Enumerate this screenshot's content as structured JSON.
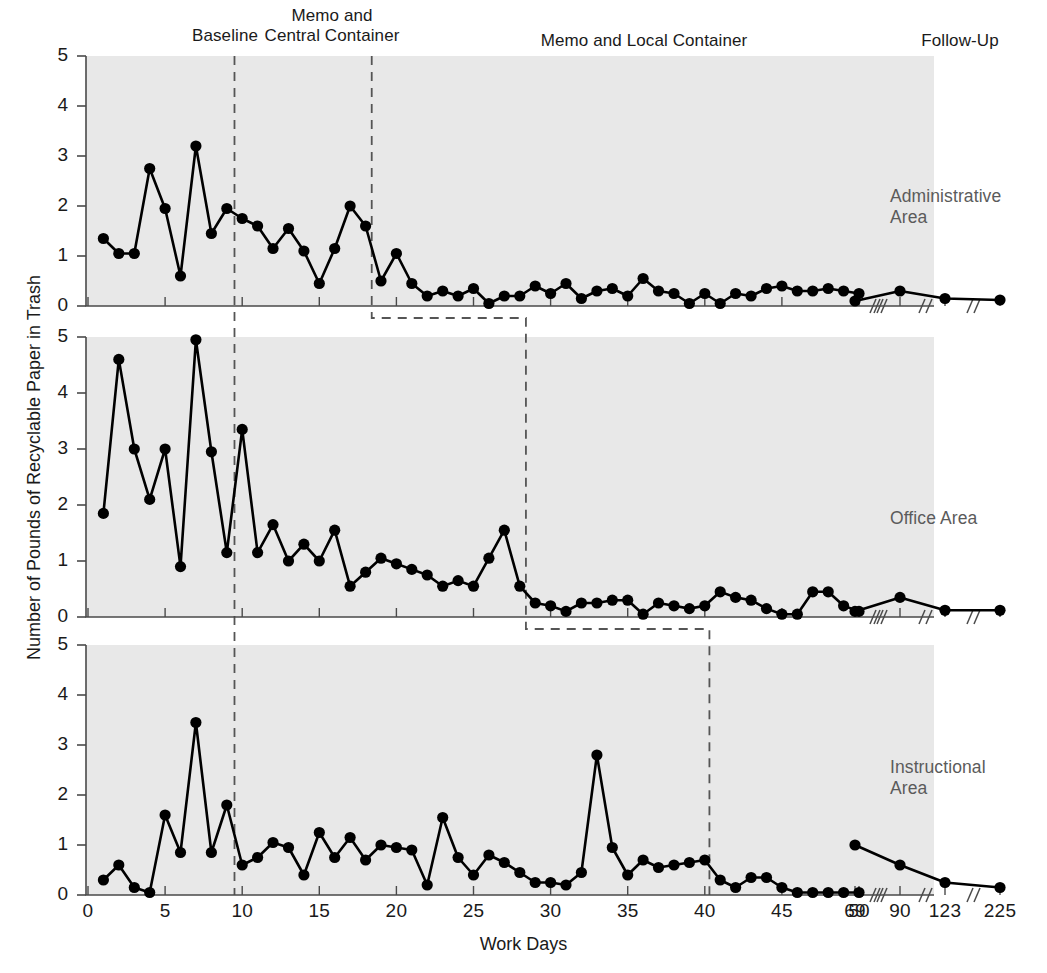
{
  "figure": {
    "xlabel": "Work Days",
    "ylabel": "Number of Pounds of Recyclable Paper in Trash",
    "phase_headers": [
      {
        "text": "Baseline",
        "x": 160,
        "y": 26,
        "width": 130
      },
      {
        "text": "Memo and\nCentral Container",
        "x": 237,
        "y": 6,
        "width": 190
      },
      {
        "text": "Memo and Local Container",
        "x": 494,
        "y": 31,
        "width": 300
      },
      {
        "text": "Follow-Up",
        "x": 880,
        "y": 31,
        "width": 160
      }
    ],
    "panel_tags": [
      {
        "text": "Administrative\nArea",
        "x": 890,
        "y": 186
      },
      {
        "text": "Office Area",
        "x": 890,
        "y": 508
      },
      {
        "text": "Instructional\nArea",
        "x": 890,
        "y": 757
      }
    ],
    "yticks": [
      0,
      1,
      2,
      3,
      4,
      5
    ],
    "xticks": [
      0,
      5,
      10,
      15,
      20,
      25,
      30,
      35,
      40,
      45,
      50,
      69,
      90,
      123,
      225
    ],
    "colors": {
      "panel_background": "#e8e8e8",
      "line": "#000000",
      "marker": "#000000",
      "phase_line": "#555555",
      "axis": "#4a4a4a",
      "tag_text": "#5b5b5b"
    }
  },
  "chart_data": {
    "type": "line",
    "title": "",
    "xlabel": "Work Days",
    "ylabel": "Number of Pounds of Recyclable Paper in Trash",
    "ylim": [
      0,
      5
    ],
    "grid": false,
    "legend": "none",
    "layout": "three stacked panels, multiple-baseline design",
    "x_axis_note": "Work days 1-50 continuous, then broken axis for follow-up days 69, 90, 123, 225",
    "phases": [
      {
        "name": "Baseline",
        "panel_breaks": [
          9.5,
          9.5,
          9.5
        ]
      },
      {
        "name": "Memo and Central Container",
        "panel_breaks": [
          18.4,
          28.4,
          40.3
        ]
      },
      {
        "name": "Memo and Local Container"
      },
      {
        "name": "Follow-Up",
        "starts_after_day": 50
      }
    ],
    "panels": [
      {
        "name": "Administrative Area",
        "phase_boundaries": [
          9.5,
          18.4
        ],
        "x": [
          1,
          2,
          3,
          4,
          5,
          6,
          7,
          8,
          9,
          10,
          11,
          12,
          13,
          14,
          15,
          16,
          17,
          18,
          19,
          20,
          21,
          22,
          23,
          24,
          25,
          26,
          27,
          28,
          29,
          30,
          31,
          32,
          33,
          34,
          35,
          36,
          37,
          38,
          39,
          40,
          41,
          42,
          43,
          44,
          45,
          46,
          47,
          48,
          49,
          50,
          69,
          90,
          123,
          225
        ],
        "values": [
          1.35,
          1.05,
          1.05,
          2.75,
          1.95,
          0.6,
          3.2,
          1.45,
          1.95,
          1.75,
          1.6,
          1.15,
          1.55,
          1.1,
          0.45,
          1.15,
          2.0,
          1.6,
          0.5,
          1.05,
          0.45,
          0.2,
          0.3,
          0.2,
          0.35,
          0.05,
          0.2,
          0.2,
          0.4,
          0.25,
          0.45,
          0.15,
          0.3,
          0.35,
          0.2,
          0.55,
          0.3,
          0.25,
          0.05,
          0.25,
          0.05,
          0.25,
          0.2,
          0.35,
          0.4,
          0.3,
          0.3,
          0.35,
          0.3,
          0.25,
          0.1,
          0.3,
          0.15,
          0.12
        ]
      },
      {
        "name": "Office Area",
        "phase_boundaries": [
          9.5,
          28.4
        ],
        "x": [
          1,
          2,
          3,
          4,
          5,
          6,
          7,
          8,
          9,
          10,
          11,
          12,
          13,
          14,
          15,
          16,
          17,
          18,
          19,
          20,
          21,
          22,
          23,
          24,
          25,
          26,
          27,
          28,
          29,
          30,
          31,
          32,
          33,
          34,
          35,
          36,
          37,
          38,
          39,
          40,
          41,
          42,
          43,
          44,
          45,
          46,
          47,
          48,
          49,
          50,
          69,
          90,
          123,
          225
        ],
        "values": [
          1.85,
          4.6,
          3.0,
          2.1,
          3.0,
          0.9,
          4.95,
          2.95,
          1.15,
          3.35,
          1.15,
          1.65,
          1.0,
          1.3,
          1.0,
          1.55,
          0.55,
          0.8,
          1.05,
          0.95,
          0.85,
          0.75,
          0.55,
          0.65,
          0.55,
          1.05,
          1.55,
          0.55,
          0.25,
          0.2,
          0.1,
          0.25,
          0.25,
          0.3,
          0.3,
          0.05,
          0.25,
          0.2,
          0.15,
          0.2,
          0.45,
          0.35,
          0.3,
          0.15,
          0.05,
          0.05,
          0.45,
          0.45,
          0.2,
          0.1,
          0.1,
          0.35,
          0.12,
          0.12
        ]
      },
      {
        "name": "Instructional Area",
        "phase_boundaries": [
          9.5,
          40.3
        ],
        "x": [
          1,
          2,
          3,
          4,
          5,
          6,
          7,
          8,
          9,
          10,
          11,
          12,
          13,
          14,
          15,
          16,
          17,
          18,
          19,
          20,
          21,
          22,
          23,
          24,
          25,
          26,
          27,
          28,
          29,
          30,
          31,
          32,
          33,
          34,
          35,
          36,
          37,
          38,
          39,
          40,
          41,
          42,
          43,
          44,
          45,
          46,
          47,
          48,
          49,
          50,
          69,
          90,
          123,
          225
        ],
        "values": [
          0.3,
          0.6,
          0.15,
          0.05,
          1.6,
          0.85,
          3.45,
          0.85,
          1.8,
          0.6,
          0.75,
          1.05,
          0.95,
          0.4,
          1.25,
          0.75,
          1.15,
          0.7,
          1.0,
          0.95,
          0.9,
          0.2,
          1.55,
          0.75,
          0.4,
          0.8,
          0.65,
          0.45,
          0.25,
          0.25,
          0.2,
          0.45,
          2.8,
          0.95,
          0.4,
          0.7,
          0.55,
          0.6,
          0.65,
          0.7,
          0.3,
          0.15,
          0.35,
          0.35,
          0.15,
          0.05,
          0.05,
          0.05,
          0.05,
          0.05,
          1.0,
          0.6,
          0.25,
          0.15
        ]
      }
    ]
  }
}
